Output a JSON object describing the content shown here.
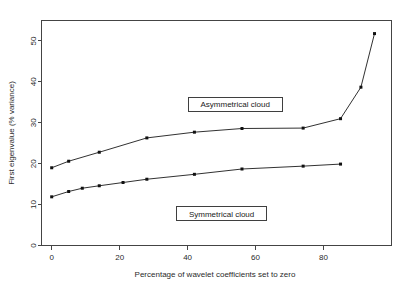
{
  "chart_data": {
    "type": "line",
    "title": "",
    "xlabel": "Percentage of wavelet coefficients set to zero",
    "ylabel": "First eigenvalue (% variance)",
    "xlim": [
      -3,
      100
    ],
    "ylim": [
      0,
      55
    ],
    "xticks": [
      0,
      20,
      40,
      60,
      80
    ],
    "yticks": [
      0,
      10,
      20,
      30,
      40,
      50
    ],
    "xtick_labels": [
      "0",
      "20",
      "40",
      "60",
      "80"
    ],
    "ytick_labels": [
      "0",
      "10",
      "20",
      "30",
      "40",
      "50"
    ],
    "grid": false,
    "legend_position": "inline-annotations",
    "series": [
      {
        "name": "Asymmetrical cloud",
        "marker": "square",
        "color": "#111111",
        "x": [
          0,
          5,
          14,
          28,
          42,
          56,
          74,
          85,
          91,
          95
        ],
        "y": [
          19.0,
          20.6,
          22.8,
          26.3,
          27.7,
          28.6,
          28.7,
          31.0,
          38.7,
          51.8
        ]
      },
      {
        "name": "Symmetrical cloud",
        "marker": "square",
        "color": "#111111",
        "x": [
          0,
          5,
          9,
          14,
          21,
          28,
          42,
          56,
          74,
          85
        ],
        "y": [
          11.9,
          13.2,
          14.0,
          14.6,
          15.4,
          16.2,
          17.4,
          18.7,
          19.4,
          19.9
        ]
      }
    ],
    "annotations": [
      {
        "label": "Asymmetrical cloud",
        "x": 54,
        "y": 34.5,
        "boxed": true
      },
      {
        "label": "Symmetrical cloud",
        "x": 50,
        "y": 7.8,
        "boxed": true
      }
    ]
  }
}
